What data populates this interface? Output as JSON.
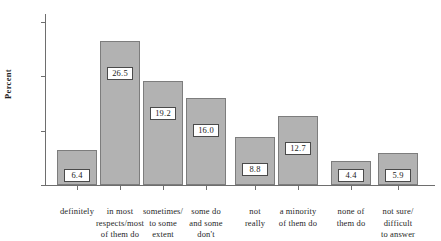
{
  "chart_data": {
    "type": "bar",
    "title": "",
    "xlabel": "",
    "ylabel": "Percent",
    "ylim": [
      0,
      32
    ],
    "yticks": [
      0,
      10,
      20,
      30
    ],
    "ytick_labels": [
      "0",
      "10",
      "20",
      "30"
    ],
    "grid": false,
    "legend": "none",
    "categories": [
      "definitely",
      "in most respects/most of them do",
      "sometimes/ to some extent",
      "some do and some don't",
      "not really",
      "a minority of them do",
      "none of them do",
      "not sure/ difficult to answer"
    ],
    "category_lines": [
      [
        "definitely"
      ],
      [
        "in most",
        "respects/most",
        "of them do"
      ],
      [
        "sometimes/",
        "to some",
        "extent"
      ],
      [
        "some do",
        "and some",
        "don't"
      ],
      [
        "not",
        "really"
      ],
      [
        "a minority",
        "of them do"
      ],
      [
        "none of",
        "them do"
      ],
      [
        "not sure/",
        "difficult",
        "to answer"
      ]
    ],
    "values": [
      6.4,
      26.5,
      19.2,
      16.0,
      8.8,
      12.7,
      4.4,
      5.9
    ],
    "value_labels": [
      "6.4",
      "26.5",
      "19.2",
      "16.0",
      "8.8",
      "12.7",
      "4.4",
      "5.9"
    ],
    "colors": {
      "bar_fill": "#b2b2b2",
      "bar_border": "#7d7d7d",
      "axis": "#6e6e6e",
      "text": "#1f1f1f",
      "value_box_fill": "#ffffff",
      "value_box_border": "#4a4a4a",
      "background": "#ffffff"
    }
  }
}
